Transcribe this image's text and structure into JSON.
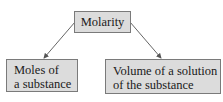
{
  "diagram": {
    "root": {
      "label": "Molarity"
    },
    "children": [
      {
        "lines": [
          "Moles of",
          "a substance"
        ]
      },
      {
        "lines": [
          "Volume of a solution",
          "of the substance"
        ]
      }
    ],
    "colors": {
      "box_fill": "#dcdcdc",
      "box_border": "#7a7a7a",
      "arrow": "#555555",
      "text": "#1a1a1a"
    }
  }
}
